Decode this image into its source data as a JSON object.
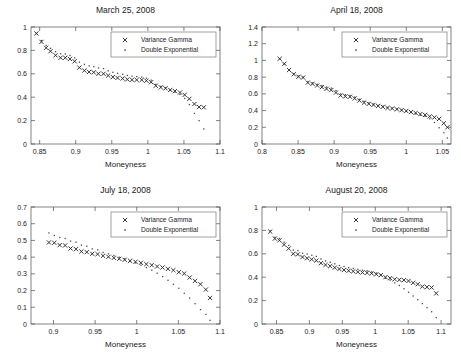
{
  "figure": {
    "xlabel": "Moneyness",
    "legend": {
      "series1": "Variance Gamma",
      "series2": "Double Exponential",
      "marker1": "x-marker",
      "marker2": "dot-marker"
    }
  },
  "chart_data": [
    {
      "type": "scatter",
      "title": "March 25, 2008",
      "xlabel": "Moneyness",
      "ylabel": "",
      "xlim": [
        0.838,
        1.1
      ],
      "ylim": [
        0,
        1
      ],
      "xticks": [
        0.85,
        0.9,
        0.95,
        1,
        1.05,
        1.1
      ],
      "xticklabels": [
        "0.85",
        "0.9",
        "0.95",
        "1",
        "1.05",
        "1.1"
      ],
      "yticks": [
        0,
        0.2,
        0.4,
        0.6,
        0.8,
        1
      ],
      "yticklabels": [
        "0",
        "0.2",
        "0.4",
        "0.6",
        "0.8",
        "1"
      ],
      "grid": false,
      "legend_position": "top-right",
      "series": [
        {
          "name": "Variance Gamma",
          "marker": "x",
          "x": [
            0.8455,
            0.8525,
            0.859,
            0.865,
            0.872,
            0.879,
            0.8855,
            0.892,
            0.8985,
            0.905,
            0.912,
            0.9185,
            0.925,
            0.9315,
            0.9385,
            0.945,
            0.9515,
            0.958,
            0.965,
            0.9715,
            0.978,
            0.9845,
            0.9915,
            0.998,
            1.0045,
            1.011,
            1.018,
            1.0245,
            1.031,
            1.0375,
            1.0445,
            1.051,
            1.0575,
            1.0645,
            1.071,
            1.0775
          ],
          "y": [
            0.945,
            0.873,
            0.822,
            0.793,
            0.758,
            0.737,
            0.737,
            0.727,
            0.707,
            0.653,
            0.628,
            0.616,
            0.612,
            0.601,
            0.6,
            0.585,
            0.572,
            0.565,
            0.56,
            0.552,
            0.549,
            0.548,
            0.548,
            0.541,
            0.528,
            0.498,
            0.484,
            0.476,
            0.462,
            0.452,
            0.44,
            0.42,
            0.386,
            0.342,
            0.316,
            0.313
          ]
        },
        {
          "name": "Double Exponential",
          "marker": ".",
          "x": [
            0.8455,
            0.8525,
            0.859,
            0.865,
            0.872,
            0.879,
            0.8855,
            0.892,
            0.8985,
            0.905,
            0.912,
            0.9185,
            0.925,
            0.9315,
            0.9385,
            0.945,
            0.9515,
            0.958,
            0.965,
            0.9715,
            0.978,
            0.9845,
            0.9915,
            0.998,
            1.0045,
            1.011,
            1.018,
            1.0245,
            1.031,
            1.0375,
            1.0445,
            1.051,
            1.0575,
            1.0645,
            1.071,
            1.0775
          ],
          "y": [
            0.945,
            0.885,
            0.843,
            0.818,
            0.79,
            0.772,
            0.77,
            0.757,
            0.736,
            0.7,
            0.681,
            0.668,
            0.662,
            0.65,
            0.645,
            0.626,
            0.613,
            0.604,
            0.596,
            0.586,
            0.58,
            0.576,
            0.573,
            0.563,
            0.546,
            0.51,
            0.493,
            0.48,
            0.462,
            0.444,
            0.424,
            0.39,
            0.338,
            0.262,
            0.2,
            0.129
          ]
        }
      ]
    },
    {
      "type": "scatter",
      "title": "April 18, 2008",
      "xlabel": "Moneyness",
      "ylabel": "",
      "xlim": [
        0.8,
        1.062
      ],
      "ylim": [
        0,
        1.4
      ],
      "xticks": [
        0.8,
        0.85,
        0.9,
        0.95,
        1,
        1.05
      ],
      "xticklabels": [
        "0.8",
        "0.85",
        "0.9",
        "0.95",
        "1",
        "1.05"
      ],
      "yticks": [
        0,
        0.2,
        0.4,
        0.6,
        0.8,
        1,
        1.2,
        1.4
      ],
      "yticklabels": [
        "0",
        "0.2",
        "0.4",
        "0.6",
        "0.8",
        "1",
        "1.2",
        "1.4"
      ],
      "grid": false,
      "legend_position": "top-right",
      "series": [
        {
          "name": "Variance Gamma",
          "marker": "x",
          "x": [
            0.8245,
            0.831,
            0.8375,
            0.844,
            0.8505,
            0.857,
            0.8635,
            0.87,
            0.8765,
            0.883,
            0.8895,
            0.896,
            0.9025,
            0.909,
            0.9155,
            0.922,
            0.9285,
            0.935,
            0.9415,
            0.948,
            0.9545,
            0.961,
            0.9675,
            0.974,
            0.9805,
            0.987,
            0.9935,
            1.0,
            1.0065,
            1.013,
            1.0195,
            1.026,
            1.0325,
            1.039,
            1.0455,
            1.052,
            1.057
          ],
          "y": [
            1.02,
            0.96,
            0.885,
            0.835,
            0.805,
            0.795,
            0.735,
            0.72,
            0.7,
            0.68,
            0.66,
            0.645,
            0.615,
            0.58,
            0.57,
            0.565,
            0.545,
            0.52,
            0.495,
            0.48,
            0.468,
            0.455,
            0.445,
            0.432,
            0.425,
            0.415,
            0.405,
            0.395,
            0.382,
            0.372,
            0.358,
            0.348,
            0.33,
            0.318,
            0.3,
            0.248,
            0.2
          ]
        },
        {
          "name": "Double Exponential",
          "marker": ".",
          "x": [
            0.8245,
            0.831,
            0.8375,
            0.844,
            0.8505,
            0.857,
            0.8635,
            0.87,
            0.8765,
            0.883,
            0.8895,
            0.896,
            0.9025,
            0.909,
            0.9155,
            0.922,
            0.9285,
            0.935,
            0.9415,
            0.948,
            0.9545,
            0.961,
            0.9675,
            0.974,
            0.9805,
            0.987,
            0.9935,
            1.0,
            1.0065,
            1.013,
            1.0195,
            1.026,
            1.0325,
            1.039,
            1.0455,
            1.052,
            1.057
          ],
          "y": [
            1.02,
            0.96,
            0.888,
            0.84,
            0.812,
            0.8,
            0.745,
            0.732,
            0.715,
            0.7,
            0.682,
            0.67,
            0.64,
            0.6,
            0.59,
            0.582,
            0.562,
            0.535,
            0.51,
            0.492,
            0.478,
            0.462,
            0.452,
            0.438,
            0.428,
            0.418,
            0.406,
            0.392,
            0.378,
            0.362,
            0.345,
            0.33,
            0.302,
            0.258,
            0.195,
            0.135,
            0.072
          ]
        }
      ]
    },
    {
      "type": "scatter",
      "title": "July 18, 2008",
      "xlabel": "Moneyness",
      "ylabel": "",
      "xlim": [
        0.873,
        1.1
      ],
      "ylim": [
        0,
        0.7
      ],
      "xticks": [
        0.9,
        0.95,
        1,
        1.05,
        1.1
      ],
      "xticklabels": [
        "0.9",
        "0.95",
        "1",
        "1.05",
        "1.1"
      ],
      "yticks": [
        0,
        0.1,
        0.2,
        0.3,
        0.4,
        0.5,
        0.6,
        0.7
      ],
      "yticklabels": [
        "0",
        "0.1",
        "0.2",
        "0.3",
        "0.4",
        "0.5",
        "0.6",
        "0.7"
      ],
      "grid": false,
      "legend_position": "top-right",
      "series": [
        {
          "name": "Variance Gamma",
          "marker": "x",
          "x": [
            0.8945,
            0.901,
            0.9075,
            0.914,
            0.9205,
            0.927,
            0.9335,
            0.94,
            0.9465,
            0.953,
            0.9595,
            0.966,
            0.9725,
            0.979,
            0.9855,
            0.992,
            0.9985,
            1.005,
            1.0115,
            1.018,
            1.0245,
            1.031,
            1.0375,
            1.044,
            1.0505,
            1.057,
            1.0635,
            1.07,
            1.0765,
            1.083,
            1.088
          ],
          "y": [
            0.488,
            0.486,
            0.472,
            0.47,
            0.452,
            0.448,
            0.434,
            0.43,
            0.42,
            0.418,
            0.408,
            0.402,
            0.396,
            0.39,
            0.384,
            0.378,
            0.372,
            0.366,
            0.358,
            0.352,
            0.344,
            0.338,
            0.33,
            0.322,
            0.31,
            0.302,
            0.278,
            0.258,
            0.238,
            0.206,
            0.156
          ]
        },
        {
          "name": "Double Exponential",
          "marker": ".",
          "x": [
            0.8945,
            0.901,
            0.9075,
            0.914,
            0.9205,
            0.927,
            0.9335,
            0.94,
            0.9465,
            0.953,
            0.9595,
            0.966,
            0.9725,
            0.979,
            0.9855,
            0.992,
            0.9985,
            1.005,
            1.0115,
            1.018,
            1.0245,
            1.031,
            1.0375,
            1.044,
            1.0505,
            1.057,
            1.0635,
            1.07,
            1.0765,
            1.083,
            1.088
          ],
          "y": [
            0.545,
            0.53,
            0.518,
            0.512,
            0.496,
            0.49,
            0.472,
            0.466,
            0.45,
            0.444,
            0.428,
            0.42,
            0.41,
            0.4,
            0.39,
            0.378,
            0.366,
            0.352,
            0.338,
            0.322,
            0.304,
            0.284,
            0.262,
            0.238,
            0.214,
            0.184,
            0.155,
            0.122,
            0.086,
            0.058,
            0.022
          ]
        }
      ]
    },
    {
      "type": "scatter",
      "title": "August 20, 2008",
      "xlabel": "Moneyness",
      "ylabel": "",
      "xlim": [
        0.828,
        1.115
      ],
      "ylim": [
        0,
        1
      ],
      "xticks": [
        0.85,
        0.9,
        0.95,
        1,
        1.05,
        1.1
      ],
      "xticklabels": [
        "0.85",
        "0.9",
        "0.95",
        "1",
        "1.05",
        "1.1"
      ],
      "yticks": [
        0,
        0.2,
        0.4,
        0.6,
        0.8,
        1
      ],
      "yticklabels": [
        "0",
        "0.2",
        "0.4",
        "0.6",
        "0.8",
        "1"
      ],
      "grid": false,
      "legend_position": "top-right",
      "series": [
        {
          "name": "Variance Gamma",
          "marker": "x",
          "x": [
            0.8405,
            0.8475,
            0.8545,
            0.8615,
            0.8685,
            0.8755,
            0.8825,
            0.8895,
            0.8965,
            0.9035,
            0.9105,
            0.9175,
            0.9245,
            0.9315,
            0.9385,
            0.9455,
            0.9525,
            0.9595,
            0.9665,
            0.9735,
            0.9805,
            0.9875,
            0.9945,
            1.0015,
            1.0085,
            1.0155,
            1.0225,
            1.0295,
            1.0365,
            1.0435,
            1.0505,
            1.0575,
            1.0645,
            1.0715,
            1.0785,
            1.0855,
            1.0925
          ],
          "y": [
            0.79,
            0.73,
            0.715,
            0.678,
            0.645,
            0.6,
            0.595,
            0.572,
            0.562,
            0.552,
            0.542,
            0.52,
            0.505,
            0.495,
            0.482,
            0.47,
            0.462,
            0.455,
            0.45,
            0.445,
            0.44,
            0.438,
            0.432,
            0.425,
            0.418,
            0.4,
            0.392,
            0.382,
            0.378,
            0.375,
            0.368,
            0.352,
            0.34,
            0.32,
            0.315,
            0.312,
            0.262
          ]
        },
        {
          "name": "Double Exponential",
          "marker": ".",
          "x": [
            0.8405,
            0.8475,
            0.8545,
            0.8615,
            0.8685,
            0.8755,
            0.8825,
            0.8895,
            0.8965,
            0.9035,
            0.9105,
            0.9175,
            0.9245,
            0.9315,
            0.9385,
            0.9455,
            0.9525,
            0.9595,
            0.9665,
            0.9735,
            0.9805,
            0.9875,
            0.9945,
            1.0015,
            1.0085,
            1.0155,
            1.0225,
            1.0295,
            1.0365,
            1.0435,
            1.0505,
            1.0575,
            1.0645,
            1.0715,
            1.0785,
            1.0855,
            1.0925
          ],
          "y": [
            0.795,
            0.742,
            0.732,
            0.7,
            0.672,
            0.632,
            0.628,
            0.605,
            0.598,
            0.588,
            0.578,
            0.556,
            0.54,
            0.528,
            0.515,
            0.5,
            0.492,
            0.482,
            0.475,
            0.468,
            0.46,
            0.455,
            0.446,
            0.436,
            0.422,
            0.392,
            0.375,
            0.352,
            0.33,
            0.302,
            0.272,
            0.24,
            0.208,
            0.175,
            0.14,
            0.105,
            0.055
          ]
        }
      ]
    }
  ]
}
